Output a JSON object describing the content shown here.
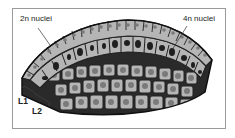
{
  "labels": {
    "two_n": "2n nuclei",
    "four_n": "4n nuclei",
    "l1": "L1",
    "l2": "L2"
  },
  "colors": {
    "cell_fill": "#b3b3b3",
    "cell_border": "#222222",
    "nucleus_2n": "#7a7a7a",
    "nucleus_4n": "#1f1f1f",
    "frame": "#9a9a9a"
  }
}
